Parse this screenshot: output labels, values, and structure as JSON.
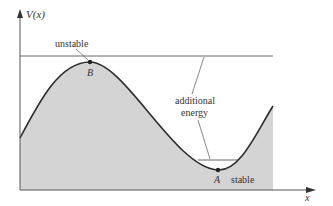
{
  "diagram": {
    "axes": {
      "y_label": "V(x)",
      "x_label": "x"
    },
    "points": [
      {
        "id": "B",
        "label": "B",
        "description": "unstable"
      },
      {
        "id": "A",
        "label": "A",
        "description": "stable"
      }
    ],
    "annotations": {
      "unstable": "unstable",
      "stable": "stable",
      "additional_line1": "additional",
      "additional_line2": "energy"
    },
    "colors": {
      "fill": "#d4d4d4",
      "curve": "#2b2b2b",
      "axis": "#555555",
      "text": "#333333"
    }
  }
}
